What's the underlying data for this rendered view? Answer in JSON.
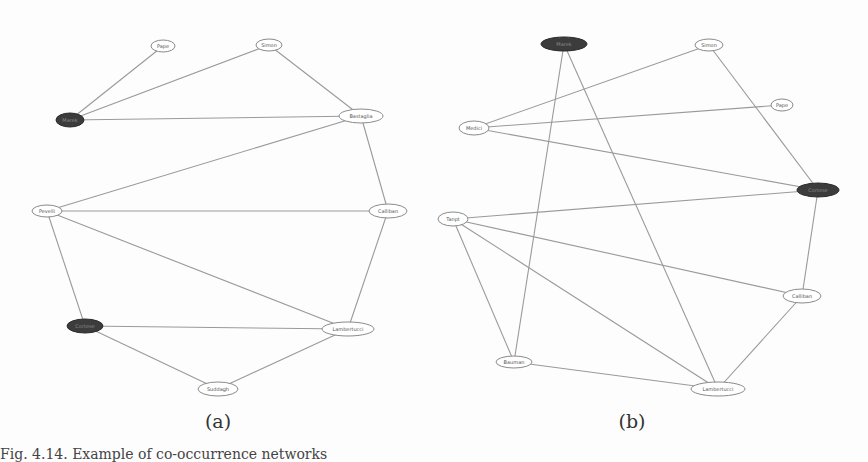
{
  "figure": {
    "subfigures": [
      {
        "label": "(a)",
        "nodes": [
          {
            "id": "a1",
            "label": "Pape",
            "x": 163,
            "y": 46,
            "rx": 12,
            "ry": 6,
            "dark": false
          },
          {
            "id": "a2",
            "label": "Simon",
            "x": 269,
            "y": 45,
            "rx": 13,
            "ry": 6,
            "dark": false
          },
          {
            "id": "a3",
            "label": "Marek",
            "x": 70,
            "y": 120,
            "rx": 14,
            "ry": 7,
            "dark": true
          },
          {
            "id": "a4",
            "label": "Bastaglia",
            "x": 361,
            "y": 116,
            "rx": 22,
            "ry": 7,
            "dark": false
          },
          {
            "id": "a5",
            "label": "Pevelli",
            "x": 47,
            "y": 211,
            "rx": 15,
            "ry": 6,
            "dark": false
          },
          {
            "id": "a6",
            "label": "Calliban",
            "x": 388,
            "y": 211,
            "rx": 19,
            "ry": 7,
            "dark": false
          },
          {
            "id": "a7",
            "label": "Cortese",
            "x": 85,
            "y": 326,
            "rx": 18,
            "ry": 7,
            "dark": true
          },
          {
            "id": "a8",
            "label": "Lambertucci",
            "x": 348,
            "y": 329,
            "rx": 26,
            "ry": 7,
            "dark": false
          },
          {
            "id": "a9",
            "label": "Suddagh",
            "x": 218,
            "y": 389,
            "rx": 20,
            "ry": 7,
            "dark": false
          }
        ],
        "edges": [
          [
            "a1",
            "a3"
          ],
          [
            "a2",
            "a3"
          ],
          [
            "a2",
            "a4"
          ],
          [
            "a3",
            "a4"
          ],
          [
            "a4",
            "a5"
          ],
          [
            "a4",
            "a6"
          ],
          [
            "a5",
            "a6"
          ],
          [
            "a5",
            "a7"
          ],
          [
            "a5",
            "a8"
          ],
          [
            "a6",
            "a8"
          ],
          [
            "a7",
            "a8"
          ],
          [
            "a7",
            "a9"
          ],
          [
            "a8",
            "a9"
          ]
        ]
      },
      {
        "label": "(b)",
        "nodes": [
          {
            "id": "b1",
            "label": "Marek",
            "x": 564,
            "y": 44,
            "rx": 23,
            "ry": 7,
            "dark": true
          },
          {
            "id": "b2",
            "label": "Simon",
            "x": 709,
            "y": 45,
            "rx": 14,
            "ry": 6,
            "dark": false
          },
          {
            "id": "b3",
            "label": "Medici",
            "x": 474,
            "y": 128,
            "rx": 15,
            "ry": 7,
            "dark": false
          },
          {
            "id": "b4",
            "label": "Pape",
            "x": 782,
            "y": 105,
            "rx": 11,
            "ry": 6,
            "dark": false
          },
          {
            "id": "b5",
            "label": "Cortese",
            "x": 818,
            "y": 190,
            "rx": 21,
            "ry": 7,
            "dark": true
          },
          {
            "id": "b6",
            "label": "Tanpt",
            "x": 453,
            "y": 219,
            "rx": 15,
            "ry": 7,
            "dark": false
          },
          {
            "id": "b7",
            "label": "Calliban",
            "x": 802,
            "y": 296,
            "rx": 19,
            "ry": 7,
            "dark": false
          },
          {
            "id": "b8",
            "label": "Bauman",
            "x": 514,
            "y": 362,
            "rx": 18,
            "ry": 6,
            "dark": false
          },
          {
            "id": "b9",
            "label": "Lambertucci",
            "x": 718,
            "y": 389,
            "rx": 27,
            "ry": 7,
            "dark": false
          }
        ],
        "edges": [
          [
            "b1",
            "b8"
          ],
          [
            "b1",
            "b9"
          ],
          [
            "b2",
            "b3"
          ],
          [
            "b2",
            "b5"
          ],
          [
            "b3",
            "b4"
          ],
          [
            "b3",
            "b5"
          ],
          [
            "b6",
            "b5"
          ],
          [
            "b6",
            "b7"
          ],
          [
            "b6",
            "b8"
          ],
          [
            "b6",
            "b9"
          ],
          [
            "b5",
            "b7"
          ],
          [
            "b7",
            "b9"
          ],
          [
            "b8",
            "b9"
          ]
        ]
      }
    ],
    "subfigure_label_positions": [
      {
        "x": 218,
        "y": 410
      },
      {
        "x": 632,
        "y": 410
      }
    ],
    "caption": "Fig. 4.14. Example of co-occurrence networks"
  }
}
